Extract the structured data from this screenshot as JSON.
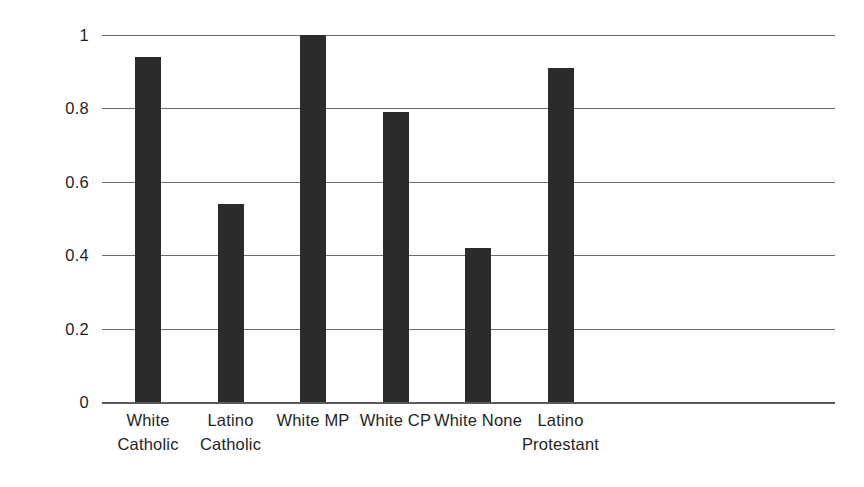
{
  "chart_data": {
    "type": "bar",
    "title": "",
    "xlabel": "",
    "ylabel": "Mean Hours",
    "categories": [
      "White Catholic",
      "Latino Catholic",
      "White MP",
      "White CP",
      "White None",
      "Latino Protestant"
    ],
    "category_lines": [
      [
        "White",
        "Catholic"
      ],
      [
        "Latino",
        "Catholic"
      ],
      [
        "White MP"
      ],
      [
        "White CP"
      ],
      [
        "White None"
      ],
      [
        "Latino",
        "Protestant"
      ]
    ],
    "values": [
      0.94,
      0.54,
      1.0,
      0.79,
      0.42,
      0.91
    ],
    "ylim": [
      0,
      1
    ],
    "yticks": [
      0,
      0.2,
      0.4,
      0.6,
      0.8,
      1
    ],
    "ytick_labels": [
      "0",
      "0.2",
      "0.4",
      "0.6",
      "0.8",
      "1"
    ],
    "grid": true,
    "legend": false,
    "bar_color": "#2b2b2b",
    "axis_color": "#6e6e6e",
    "background_color": "#ffffff"
  }
}
